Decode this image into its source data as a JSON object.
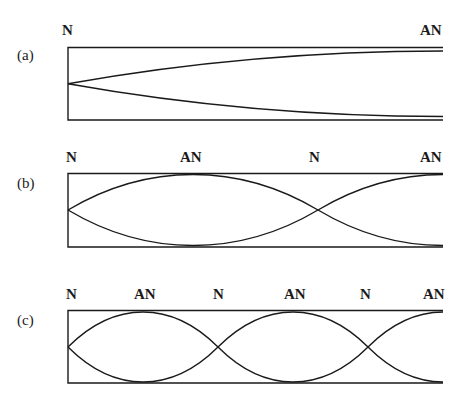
{
  "panels": [
    {
      "id": "a",
      "label": "(a)",
      "markers": [
        "N",
        "AN"
      ],
      "quarter_wavelengths": 1
    },
    {
      "id": "b",
      "label": "(b)",
      "markers": [
        "N",
        "AN",
        "N",
        "AN"
      ],
      "quarter_wavelengths": 3
    },
    {
      "id": "c",
      "label": "(c)",
      "markers": [
        "N",
        "AN",
        "N",
        "AN",
        "N",
        "AN"
      ],
      "quarter_wavelengths": 5
    }
  ],
  "colors": {
    "line": "#1a1a1a",
    "background": "#ffffff"
  }
}
